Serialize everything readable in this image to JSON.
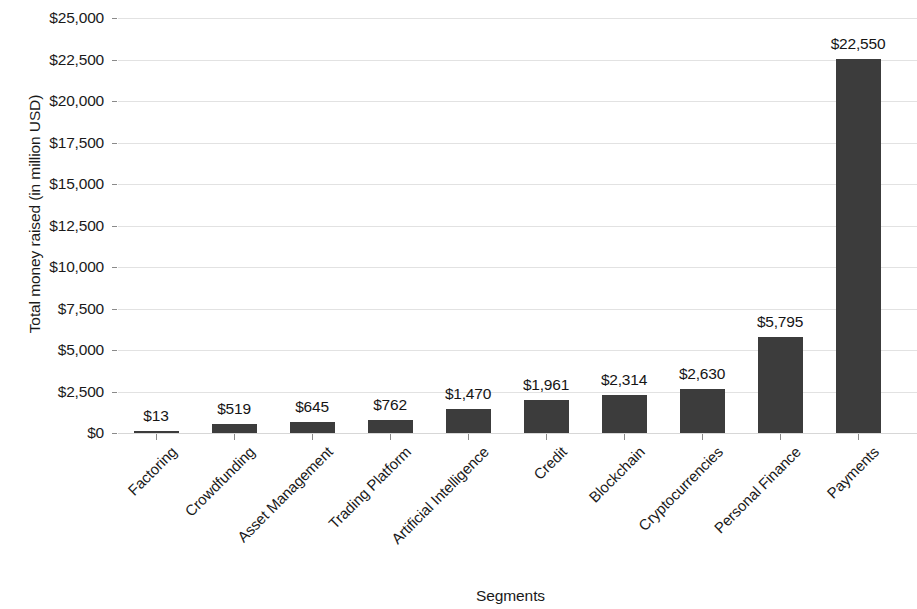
{
  "chart_data": {
    "type": "bar",
    "title": "",
    "xlabel": "Segments",
    "ylabel": "Total money raised (in million USD)",
    "categories": [
      "Factoring",
      "Crowdfunding",
      "Asset Management",
      "Trading Platform",
      "Artificial Intelligence",
      "Credit",
      "Blockchain",
      "Cryptocurrencies",
      "Personal Finance",
      "Payments"
    ],
    "values": [
      13,
      519,
      645,
      762,
      1470,
      1961,
      2314,
      2630,
      5795,
      22550
    ],
    "value_labels": [
      "$13",
      "$519",
      "$645",
      "$762",
      "$1,470",
      "$1,961",
      "$2,314",
      "$2,630",
      "$5,795",
      "$22,550"
    ],
    "ylim": [
      0,
      25000
    ],
    "ytick_values": [
      25000,
      22500,
      20000,
      17500,
      15000,
      12500,
      10000,
      7500,
      5000,
      2500,
      0
    ],
    "ytick_labels": [
      "$25,000",
      "$22,500",
      "$20,000",
      "$17,500",
      "$15,000",
      "$12,500",
      "$10,000",
      "$7,500",
      "$5,000",
      "$2,500",
      "$0"
    ],
    "grid": true,
    "grid_axis": "y",
    "legend": false,
    "bar_color": "#3c3c3c",
    "grid_color": "#e2e2e2",
    "text_color": "#1a1a1a",
    "background_color": "#ffffff",
    "xtick_label_rotation": -45
  }
}
